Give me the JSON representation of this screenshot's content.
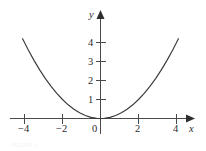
{
  "figure": {
    "background_color": "#ffffff",
    "axis_color": "#4a4a4a",
    "curve_color": "#3a3a3a",
    "label_color": "#2b2b2b",
    "caption_faint": "FIGURE 1"
  },
  "axes": {
    "x_axis_name": "x",
    "y_axis_name": "y",
    "origin_label": "0"
  },
  "chart_data": {
    "type": "line",
    "title": "",
    "subtitle": "",
    "xlabel": "x",
    "ylabel": "y",
    "function": "y = x^2/4",
    "xlim": [
      -4.6,
      4.6
    ],
    "ylim": [
      -0.7,
      4.6
    ],
    "grid": false,
    "legend": false,
    "xticks": [
      -4,
      -2,
      2,
      4
    ],
    "xtick_labels": [
      "−4",
      "−2",
      "2",
      "4"
    ],
    "yticks": [
      1,
      2,
      3,
      4
    ],
    "ytick_labels": [
      "1",
      "2",
      "3",
      "4"
    ],
    "origin_tick_label": "0",
    "series": [
      {
        "name": "y = x^2/4",
        "x": [
          -4.1,
          -3.8,
          -3.5,
          -3.2,
          -2.9,
          -2.6,
          -2.3,
          -2.0,
          -1.7,
          -1.4,
          -1.1,
          -0.8,
          -0.5,
          -0.2,
          0.0,
          0.2,
          0.5,
          0.8,
          1.1,
          1.4,
          1.7,
          2.0,
          2.3,
          2.6,
          2.9,
          3.2,
          3.5,
          3.8,
          4.1
        ],
        "y": [
          4.2,
          3.61,
          3.06,
          2.56,
          2.1,
          1.69,
          1.32,
          1.0,
          0.72,
          0.49,
          0.3,
          0.16,
          0.06,
          0.01,
          0.0,
          0.01,
          0.06,
          0.16,
          0.3,
          0.49,
          0.72,
          1.0,
          1.32,
          1.69,
          2.1,
          2.56,
          3.06,
          3.61,
          4.2
        ]
      }
    ]
  },
  "ticks": {
    "x_negative_four": "−4",
    "x_negative_two": "−2",
    "x_positive_two": "2",
    "x_positive_four": "4",
    "y_one": "1",
    "y_two": "2",
    "y_three": "3",
    "y_four": "4"
  }
}
